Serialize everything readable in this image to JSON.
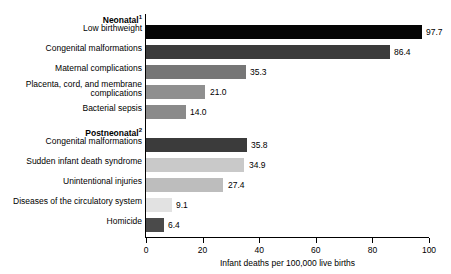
{
  "chart_data": {
    "type": "bar",
    "orientation": "horizontal",
    "title": "",
    "xlabel": "Infant deaths per 100,000 live births",
    "ylabel": "",
    "xlim": [
      0,
      100
    ],
    "xticks": [
      0,
      20,
      40,
      60,
      80,
      100
    ],
    "grid": false,
    "legend": null,
    "groups": [
      {
        "heading": "Neonatal",
        "heading_footnote": "1",
        "categories": [
          "Low birthweight",
          "Congenital malformations",
          "Maternal complications",
          "Placenta, cord, and membrane\ncomplications",
          "Bacterial sepsis"
        ],
        "values": [
          97.7,
          86.4,
          35.3,
          21.0,
          14.0
        ],
        "value_labels": [
          "97.7",
          "86.4",
          "35.3",
          "21.0",
          "14.0"
        ],
        "colors": [
          "#050505",
          "#3b3b3b",
          "#767676",
          "#8f8f8f",
          "#8a8a8a"
        ]
      },
      {
        "heading": "Postneonatal",
        "heading_footnote": "2",
        "categories": [
          "Congenital malformations",
          "Sudden infant death syndrome",
          "Unintentional injuries",
          "Diseases of the circulatory system",
          "Homicide"
        ],
        "values": [
          35.8,
          34.9,
          27.4,
          9.1,
          6.4
        ],
        "value_labels": [
          "35.8",
          "34.9",
          "27.4",
          "9.1",
          "6.4"
        ],
        "colors": [
          "#3b3b3b",
          "#c9c9c9",
          "#bdbdbd",
          "#e2e2e2",
          "#4a4a4a"
        ]
      }
    ]
  },
  "axis": {
    "tick_labels": [
      "0",
      "20",
      "40",
      "60",
      "80",
      "100"
    ],
    "x_title": "Infant deaths per 100,000 live births"
  },
  "groups": {
    "neonatal": {
      "heading": "Neonatal",
      "footnote": "1",
      "rows": [
        {
          "label": "Low birthweight",
          "value": "97.7"
        },
        {
          "label": "Congenital malformations",
          "value": "86.4"
        },
        {
          "label": "Maternal complications",
          "value": "35.3"
        },
        {
          "label": "Placenta, cord, and membrane\ncomplications",
          "value": "21.0"
        },
        {
          "label": "Bacterial sepsis",
          "value": "14.0"
        }
      ]
    },
    "postneonatal": {
      "heading": "Postneonatal",
      "footnote": "2",
      "rows": [
        {
          "label": "Congenital malformations",
          "value": "35.8"
        },
        {
          "label": "Sudden infant death syndrome",
          "value": "34.9"
        },
        {
          "label": "Unintentional injuries",
          "value": "27.4"
        },
        {
          "label": "Diseases of the circulatory system",
          "value": "9.1"
        },
        {
          "label": "Homicide",
          "value": "6.4"
        }
      ]
    }
  }
}
